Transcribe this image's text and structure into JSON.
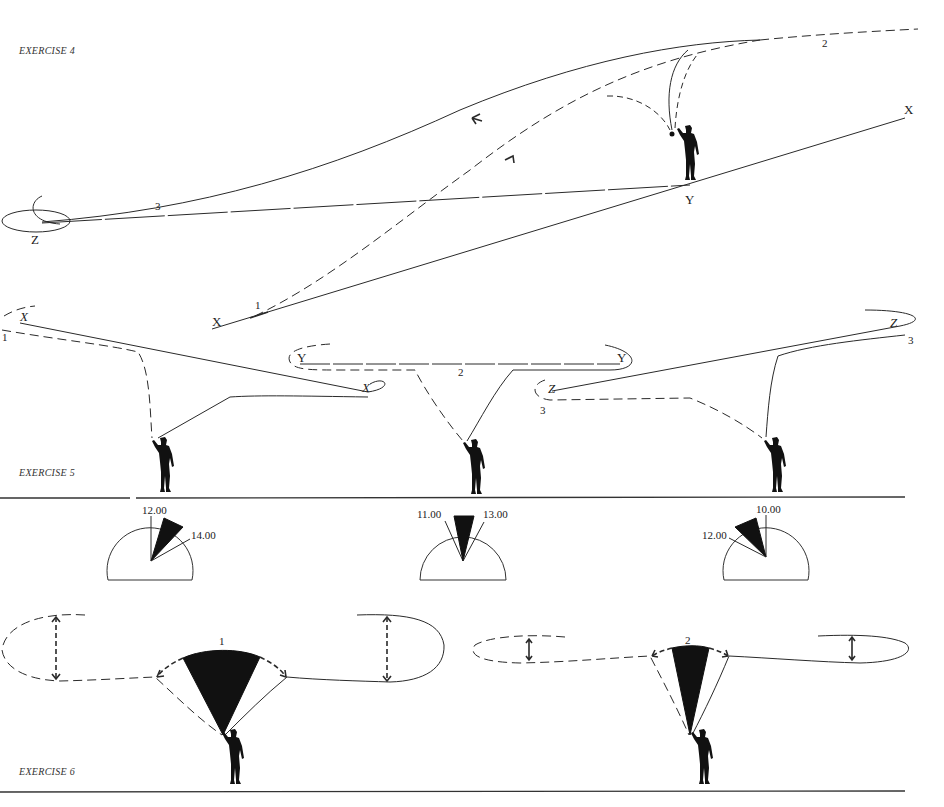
{
  "page": {
    "background": "#ffffff",
    "ink_color": "#222222"
  },
  "exercise4": {
    "title": "EXERCISE 4",
    "labels": {
      "x_right": "X",
      "y_angler": "Y",
      "z_left": "Z",
      "x_lower": "X",
      "line1": "1",
      "line2": "2",
      "line3": "3"
    },
    "arrows": [
      "arrow-back-cast",
      "arrow-forward-cast"
    ]
  },
  "exercise5": {
    "title": "EXERCISE 5",
    "casts": [
      {
        "number": "1",
        "target_labels": [
          "X",
          "X"
        ],
        "dial": {
          "start": "12.00",
          "end": "14.00"
        }
      },
      {
        "number": "2",
        "target_labels": [
          "Y",
          "Y"
        ],
        "dial": {
          "start": "11.00",
          "end": "13.00"
        }
      },
      {
        "number": "3",
        "target_labels": [
          "Z",
          "Z"
        ],
        "dial": {
          "start": "10.00",
          "end": "12.00"
        }
      }
    ]
  },
  "exercise6": {
    "title": "EXERCISE 6",
    "casts": [
      {
        "number": "1",
        "arc": "wide",
        "loop": "wide"
      },
      {
        "number": "2",
        "arc": "narrow",
        "loop": "narrow"
      }
    ]
  }
}
